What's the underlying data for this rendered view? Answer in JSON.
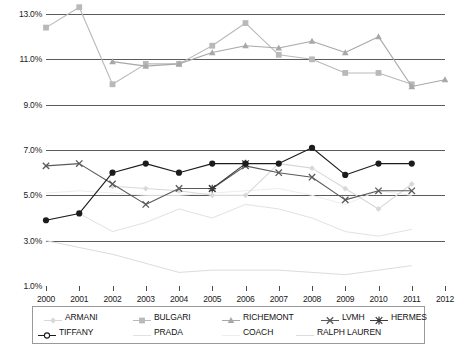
{
  "chart_data": {
    "type": "line",
    "title": "",
    "subtitle": "",
    "xlabel": "",
    "ylabel": "",
    "x": [
      2000,
      2001,
      2002,
      2003,
      2004,
      2005,
      2006,
      2007,
      2008,
      2009,
      2010,
      2011,
      2012
    ],
    "xlim": [
      2000,
      2012
    ],
    "ylim": [
      1.0,
      13.0
    ],
    "yticks": [
      13.0,
      11.0,
      9.0,
      7.0,
      5.0,
      3.0,
      1.0
    ],
    "ytick_labels": [
      "13.0%",
      "11.0%",
      "9.0%",
      "7.0%",
      "5.0%",
      "3.0%",
      "1.0%"
    ],
    "xtick_labels": [
      "2000",
      "2001",
      "2002",
      "2003",
      "2004",
      "2005",
      "2006",
      "2007",
      "2008",
      "2009",
      "2010",
      "2011",
      "2012"
    ],
    "grid": true,
    "grid_axis": "y",
    "legend_position": "bottom",
    "series": [
      {
        "name": "ARMANI",
        "marker": "diamond",
        "color": "#d8d8d8",
        "x": [
          2002,
          2003,
          2004,
          2005,
          2006,
          2007,
          2008,
          2009,
          2010,
          2011
        ],
        "values": [
          5.4,
          5.3,
          5.2,
          5.0,
          5.0,
          6.4,
          6.2,
          5.3,
          4.4,
          5.5
        ]
      },
      {
        "name": "BULGARI",
        "marker": "square",
        "color": "#b9b9b9",
        "x": [
          2000,
          2001,
          2002,
          2003,
          2004,
          2005,
          2006,
          2007,
          2008,
          2009,
          2010,
          2011
        ],
        "values": [
          12.4,
          13.3,
          9.9,
          10.8,
          10.8,
          11.6,
          12.6,
          11.2,
          11.0,
          10.4,
          10.4,
          9.9
        ]
      },
      {
        "name": "RICHEMONT",
        "marker": "triangle",
        "color": "#a8a8a8",
        "x": [
          2002,
          2003,
          2004,
          2005,
          2006,
          2007,
          2008,
          2009,
          2010,
          2011,
          2012
        ],
        "values": [
          10.9,
          10.7,
          10.8,
          11.3,
          11.6,
          11.5,
          11.8,
          11.3,
          12.0,
          9.8,
          10.1
        ]
      },
      {
        "name": "LVMH",
        "marker": "x",
        "color": "#5a5a5a",
        "x": [
          2000,
          2001,
          2002,
          2003,
          2004,
          2005,
          2006,
          2007,
          2008,
          2009,
          2010,
          2011
        ],
        "values": [
          6.3,
          6.4,
          5.5,
          4.6,
          5.3,
          5.3,
          6.3,
          6.0,
          5.8,
          4.8,
          5.2,
          5.2
        ]
      },
      {
        "name": "HERMES",
        "marker": "star",
        "color": "#3a3a3a",
        "x": [
          2005,
          2006
        ],
        "values": [
          5.3,
          6.4
        ]
      },
      {
        "name": "TIFFANY",
        "marker": "circle",
        "color": "#1c1c1c",
        "x": [
          2000,
          2001,
          2002,
          2003,
          2004,
          2005,
          2006,
          2007,
          2008,
          2009,
          2010,
          2011
        ],
        "values": [
          3.9,
          4.2,
          6.0,
          6.4,
          6.0,
          6.4,
          6.4,
          6.4,
          7.1,
          5.9,
          6.4,
          6.4
        ]
      },
      {
        "name": "PRADA",
        "marker": "none",
        "color": "#e2e2e2",
        "x": [
          2000,
          2001,
          2002,
          2003,
          2004,
          2005,
          2006,
          2007,
          2008,
          2009,
          2010,
          2011
        ],
        "values": [
          3.9,
          4.2,
          3.4,
          3.8,
          4.4,
          4.0,
          4.6,
          4.4,
          4.0,
          3.4,
          3.2,
          3.5
        ]
      },
      {
        "name": "COACH",
        "marker": "none",
        "color": "#ededed",
        "x": [
          2000,
          2001,
          2002,
          2003,
          2004,
          2005,
          2006,
          2007,
          2008,
          2009,
          2010,
          2011
        ],
        "values": [
          5.1,
          5.2,
          5.1,
          5.0,
          5.0,
          5.1,
          5.2,
          5.3,
          5.0,
          4.6,
          5.2,
          5.0
        ]
      },
      {
        "name": "RALPH LAUREN",
        "marker": "none",
        "color": "#dcdcdc",
        "x": [
          2000,
          2001,
          2002,
          2003,
          2004,
          2005,
          2006,
          2007,
          2008,
          2009,
          2010,
          2011
        ],
        "values": [
          3.0,
          2.7,
          2.4,
          2.0,
          1.6,
          1.7,
          1.7,
          1.7,
          1.6,
          1.5,
          1.7,
          1.9
        ]
      }
    ],
    "legend_entries": [
      {
        "label": "ARMANI",
        "marker": "diamond",
        "color": "#d8d8d8"
      },
      {
        "label": "BULGARI",
        "marker": "square",
        "color": "#b9b9b9"
      },
      {
        "label": "RICHEMONT",
        "marker": "triangle",
        "color": "#a8a8a8"
      },
      {
        "label": "LVMH",
        "marker": "x",
        "color": "#5a5a5a"
      },
      {
        "label": "HERMES",
        "marker": "star",
        "color": "#3a3a3a"
      },
      {
        "label": "TIFFANY",
        "marker": "circle-open",
        "color": "#1c1c1c"
      },
      {
        "label": "PRADA",
        "marker": "none",
        "color": "#e2e2e2"
      },
      {
        "label": "COACH",
        "marker": "none",
        "color": "#ededed"
      },
      {
        "label": "RALPH LAUREN",
        "marker": "none",
        "color": "#dcdcdc"
      }
    ]
  },
  "colors": {
    "gridline": "#5b5b5b",
    "axis_text": "#1a1a1a",
    "legend_border": "#9a9a9a",
    "background": "#ffffff"
  }
}
